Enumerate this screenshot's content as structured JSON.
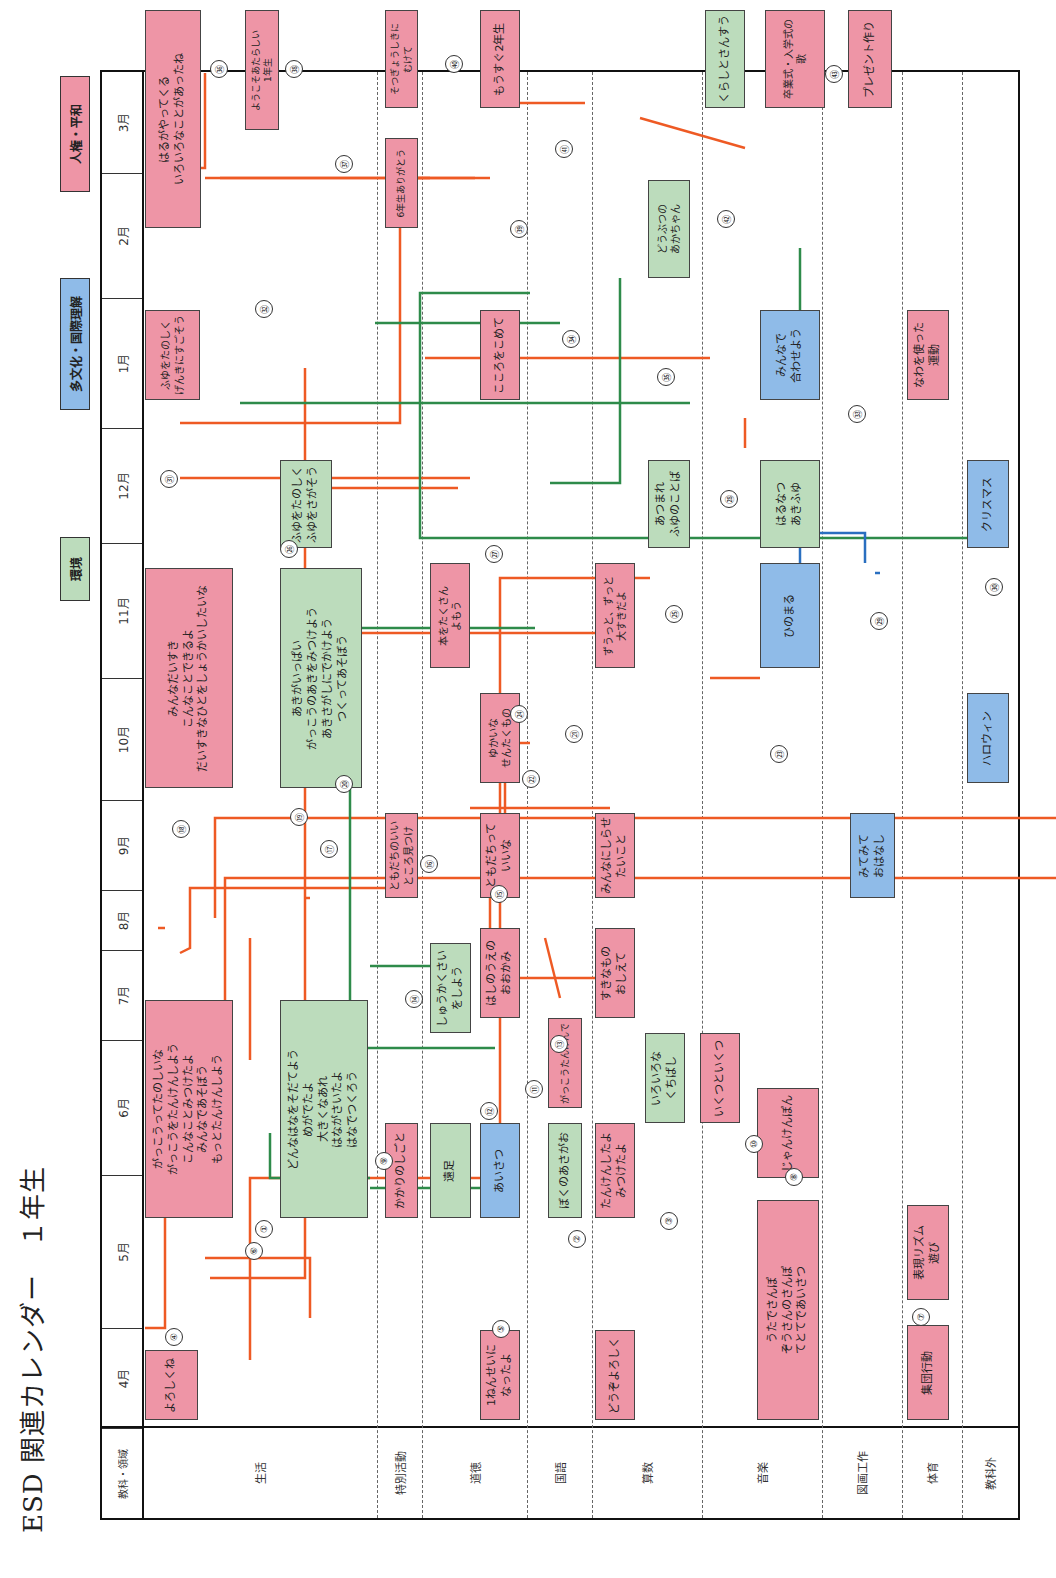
{
  "title": "ESD 関連カレンダー　１年生",
  "legend": [
    {
      "label": "環境",
      "color": "#bcdcbc"
    },
    {
      "label": "多文化・国際理解",
      "color": "#8fbbe8"
    },
    {
      "label": "人権・平和",
      "color": "#ee95a6"
    }
  ],
  "header": {
    "corner": "教科・領域",
    "months": [
      "4月",
      "5月",
      "6月",
      "7月",
      "8月",
      "9月",
      "10月",
      "11月",
      "12月",
      "1月",
      "2月",
      "3月"
    ]
  },
  "subjects": [
    "生活",
    "特別活動",
    "道徳",
    "国語",
    "算数",
    "音楽",
    "図画工作",
    "体育",
    "教科外"
  ],
  "boxes": [
    {
      "id": "b1",
      "text": "よろしくね",
      "color": "pink"
    },
    {
      "id": "b2",
      "text": "がっこうってたのしいな\nがっこうをたんけんしよう\nこんなことみつけたよ\nみんなであそぼう\nもっとたんけんしよう",
      "color": "pink"
    },
    {
      "id": "b3",
      "text": "どんなはなをそだてよう\nめがでたよ\n大きくなあれ\nはながさいたよ\nはなでつくろう",
      "color": "green"
    },
    {
      "id": "b4",
      "text": "かかりのしごと",
      "color": "pink"
    },
    {
      "id": "b5",
      "text": "遠足",
      "color": "green"
    },
    {
      "id": "b6",
      "text": "しゅうかくさいをしよう",
      "color": "green"
    },
    {
      "id": "b7",
      "text": "1ねんせいに\nなったよ",
      "color": "pink"
    },
    {
      "id": "b8",
      "text": "あいさつ",
      "color": "blue"
    },
    {
      "id": "b9",
      "text": "ぼくのあさがお",
      "color": "green"
    },
    {
      "id": "b10",
      "text": "はしのうえの\nおおかみ",
      "color": "pink"
    },
    {
      "id": "b11",
      "text": "がっこうたんけんで",
      "color": "pink"
    },
    {
      "id": "b12",
      "text": "どうぞよろしく",
      "color": "pink"
    },
    {
      "id": "b13",
      "text": "たんけんしたよ\nみつけたよ",
      "color": "pink"
    },
    {
      "id": "b14",
      "text": "すきなもの\nおしえて",
      "color": "pink"
    },
    {
      "id": "b15",
      "text": "いろいろな\nくちばし",
      "color": "green"
    },
    {
      "id": "b16",
      "text": "いくつといくつ",
      "color": "pink"
    },
    {
      "id": "b17",
      "text": "うたでさんぽ\nぞうさんのさんぽ\nてとてであいさつ",
      "color": "pink"
    },
    {
      "id": "b18",
      "text": "じゃんけんぽん",
      "color": "pink"
    },
    {
      "id": "b19",
      "text": "集団行動",
      "color": "pink"
    },
    {
      "id": "b20",
      "text": "表現リズム\n遊び",
      "color": "pink"
    },
    {
      "id": "b21",
      "text": "ともだちのいい\nところ見つけ",
      "color": "pink"
    },
    {
      "id": "b22",
      "text": "ともだちって\nいいな",
      "color": "pink"
    },
    {
      "id": "b23",
      "text": "みんなにしらせ\nたいこと",
      "color": "pink"
    },
    {
      "id": "b24",
      "text": "みてみて\nおはなし",
      "color": "blue"
    },
    {
      "id": "b25",
      "text": "みんなだいすき\nこんなことできるよ\nだいすきなひとをしょうかいしたいな",
      "color": "pink"
    },
    {
      "id": "b26",
      "text": "あきがいっぱい\nがっこうのあきをみつけよう\nあきさがしにでかけよう\nつくってあそぼう",
      "color": "green"
    },
    {
      "id": "b27",
      "text": "ゆかいな\nせんたくもの",
      "color": "pink"
    },
    {
      "id": "b28",
      "text": "本をたくさん\nよもう",
      "color": "pink"
    },
    {
      "id": "b29",
      "text": "ずうっと、ずっと\n大すきだよ",
      "color": "pink"
    },
    {
      "id": "b30",
      "text": "ひのまる",
      "color": "blue"
    },
    {
      "id": "b31",
      "text": "ハロウィン",
      "color": "blue"
    },
    {
      "id": "b32",
      "text": "ふゆをたのしく\nふゆをさがそう",
      "color": "green"
    },
    {
      "id": "b33",
      "text": "あつまれ\nふゆのことば",
      "color": "green"
    },
    {
      "id": "b34",
      "text": "はるなつ\nあきふゆ",
      "color": "green"
    },
    {
      "id": "b35",
      "text": "クリスマス",
      "color": "blue"
    },
    {
      "id": "b36",
      "text": "ふゆをたのしく\nげんきにすごそう",
      "color": "pink"
    },
    {
      "id": "b37",
      "text": "こころをこめて",
      "color": "pink"
    },
    {
      "id": "b38",
      "text": "どうぶつの\nあかちゃん",
      "color": "green"
    },
    {
      "id": "b39",
      "text": "みんなで\n合わせよう",
      "color": "blue"
    },
    {
      "id": "b40",
      "text": "なわを使った\n運動",
      "color": "pink"
    },
    {
      "id": "b41",
      "text": "はるがやってくる\nいろいろなことがあったね",
      "color": "pink"
    },
    {
      "id": "b42",
      "text": "ようこそあたらしい\n1年生",
      "color": "pink"
    },
    {
      "id": "b43",
      "text": "6年生ありがとう",
      "color": "pink"
    },
    {
      "id": "b44",
      "text": "そつぎょうしきに\nむけて",
      "color": "pink"
    },
    {
      "id": "b45",
      "text": "もうすぐ2年生",
      "color": "pink"
    },
    {
      "id": "b46",
      "text": "くらしとさんすう",
      "color": "green"
    },
    {
      "id": "b47",
      "text": "卒業式・入学式の\n歌",
      "color": "pink"
    },
    {
      "id": "b48",
      "text": "プレゼント作り",
      "color": "pink"
    }
  ],
  "link_numbers": [
    "①",
    "②",
    "③",
    "④",
    "⑤",
    "⑥",
    "⑦",
    "⑧",
    "⑨",
    "⑩",
    "⑪",
    "⑫",
    "⑬",
    "⑭",
    "⑮",
    "⑯",
    "⑰",
    "⑱",
    "⑲",
    "⑳",
    "㉑",
    "㉒",
    "㉓",
    "㉔",
    "㉕",
    "㉖",
    "㉗",
    "㉘",
    "㉙",
    "㉚",
    "㉛",
    "㉜",
    "㉝",
    "㉞",
    "㉟",
    "㊱",
    "㊲",
    "㊳",
    "㊴",
    "㊵",
    "㊶",
    "㊷",
    "㊸"
  ],
  "colors": {
    "environment": "#bcdcbc",
    "multicultural": "#8fbbe8",
    "human_rights": "#ee95a6",
    "line_orange": "#ee5a24",
    "line_green": "#2e8b4a",
    "line_blue": "#2a6fc0"
  }
}
